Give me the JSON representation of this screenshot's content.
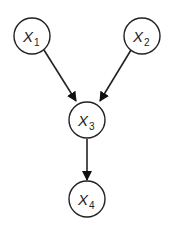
{
  "diagram": {
    "type": "directed-graph",
    "nodes": [
      {
        "id": "x1",
        "label": "X",
        "subscript": "1"
      },
      {
        "id": "x2",
        "label": "X",
        "subscript": "2"
      },
      {
        "id": "x3",
        "label": "X",
        "subscript": "3"
      },
      {
        "id": "x4",
        "label": "X",
        "subscript": "4"
      }
    ],
    "edges": [
      {
        "from": "x1",
        "to": "x3"
      },
      {
        "from": "x2",
        "to": "x3"
      },
      {
        "from": "x3",
        "to": "x4"
      }
    ],
    "colors": {
      "stroke": "#222222",
      "fill": "#ffffff"
    }
  }
}
